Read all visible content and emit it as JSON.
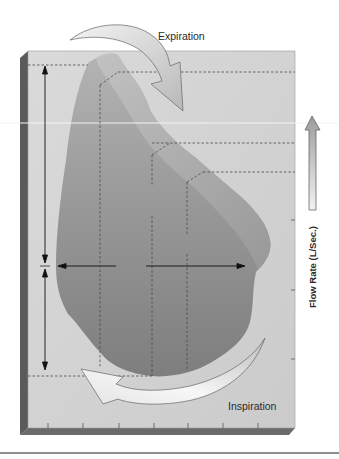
{
  "diagram": {
    "type": "flow-volume-loop",
    "labels": {
      "expiration": "Expiration",
      "inspiration": "Inspiration",
      "y_axis": "Flow Rate (L/Sec.)"
    },
    "colors": {
      "panel": "#d2d2d2",
      "panel_side": "#5a5a5a",
      "panel_bottom": "#6a6a6a",
      "loop_fill": "#8e8e8e",
      "loop_band": "#a9a9a9",
      "dashed": "#4a4a4a",
      "arrow_line": "#111111",
      "curved_arrow_fill": "#efefef",
      "background": "#ffffff"
    },
    "x_ticks_count": 7,
    "y_ticks_count": 3
  }
}
